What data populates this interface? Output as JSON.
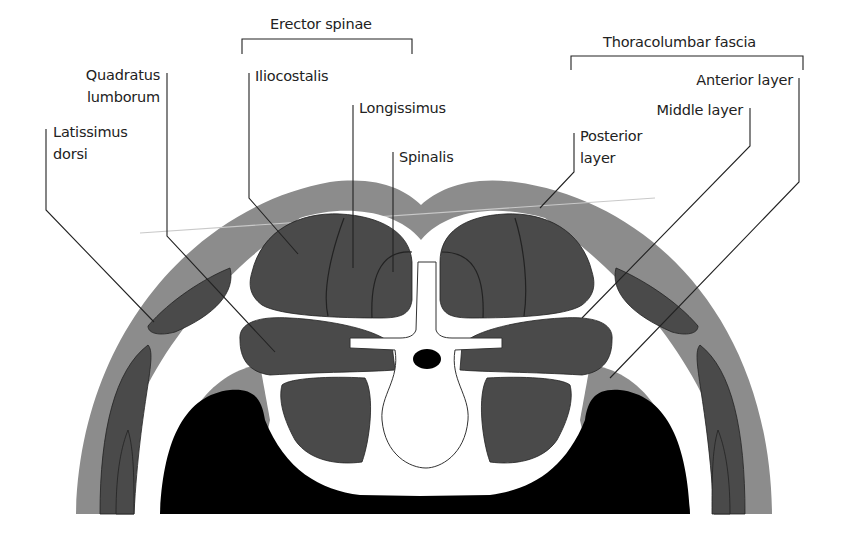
{
  "diagram": {
    "type": "anatomical cross-section",
    "groups": [
      {
        "id": "erector",
        "label": "Erector spinae"
      },
      {
        "id": "fascia",
        "label": "Thoracolumbar fascia"
      }
    ],
    "labels": {
      "quadratus": "Quadratus\nlumborum",
      "quadratus_l1": "Quadratus",
      "quadratus_l2": "lumborum",
      "latissimus_l1": "Latissimus",
      "latissimus_l2": "dorsi",
      "iliocostalis": "Iliocostalis",
      "longissimus": "Longissimus",
      "spinalis": "Spinalis",
      "posterior_l1": "Posterior",
      "posterior_l2": "layer",
      "middle": "Middle layer",
      "anterior": "Anterior layer"
    },
    "colors": {
      "skin": "#8c8c8c",
      "muscle": "#4a4a4a",
      "fascia": "#ffffff",
      "cavity": "#000000",
      "bone": "#ffffff",
      "background": "#ffffff"
    }
  }
}
